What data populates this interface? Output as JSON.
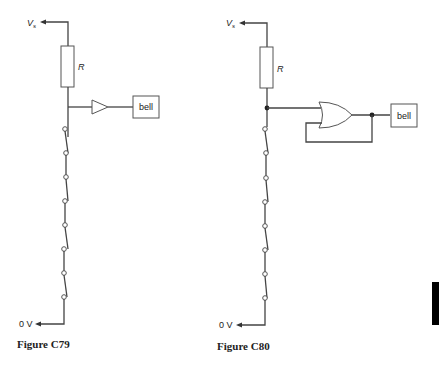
{
  "figures": [
    {
      "id": "C79",
      "caption": "Figure C79",
      "supply_label": "V",
      "supply_subscript": "s",
      "ground_label": "0 V",
      "resistor_label": "R",
      "gate_type": "buffer",
      "output_label": "bell",
      "switch_count": 4
    },
    {
      "id": "C80",
      "caption": "Figure C80",
      "supply_label": "V",
      "supply_subscript": "s",
      "ground_label": "0 V",
      "resistor_label": "R",
      "gate_type": "OR (latched, output fed back to input)",
      "output_label": "bell",
      "switch_count": 4
    }
  ],
  "colors": {
    "wire": "#444444",
    "text": "#222222",
    "edge_tab": "#000000"
  }
}
